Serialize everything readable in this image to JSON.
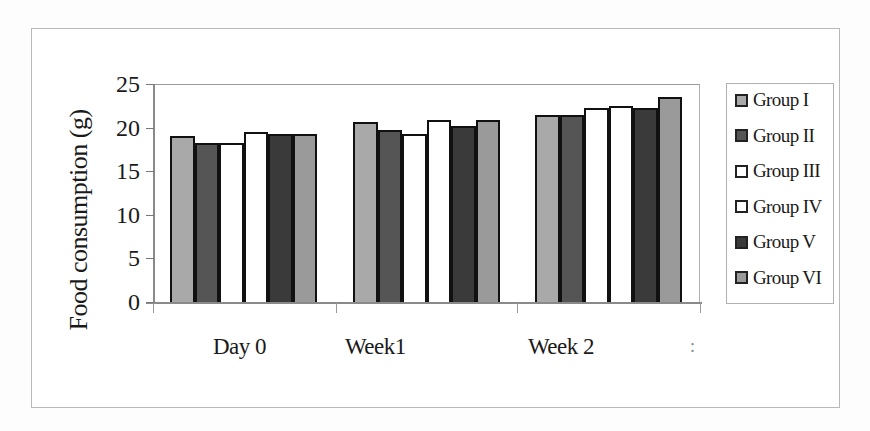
{
  "chart_data": {
    "type": "bar",
    "title": "",
    "xlabel": "",
    "ylabel": "Food consumption (g)",
    "ylim": [
      0,
      25
    ],
    "yticks": [
      0,
      5,
      10,
      15,
      20,
      25
    ],
    "grid": false,
    "legend_position": "right",
    "categories": [
      "Day 0",
      "Week1",
      "Week 2"
    ],
    "series": [
      {
        "name": "Group I",
        "color": "#a9a9a9",
        "values": [
          19.0,
          20.6,
          21.5
        ]
      },
      {
        "name": "Group II",
        "color": "#555555",
        "values": [
          18.2,
          19.7,
          21.5
        ]
      },
      {
        "name": "Group III",
        "color": "#ffffff",
        "values": [
          18.2,
          19.3,
          22.2
        ]
      },
      {
        "name": "Group IV",
        "color": "#ffffff",
        "values": [
          19.5,
          20.9,
          22.5
        ]
      },
      {
        "name": "Group V",
        "color": "#3a3a3a",
        "values": [
          19.3,
          20.2,
          22.2
        ]
      },
      {
        "name": "Group VI",
        "color": "#9a9a9a",
        "values": [
          19.3,
          20.9,
          23.5
        ]
      }
    ]
  },
  "axis": {
    "ytick_labels": [
      "25",
      "20",
      "15",
      "10",
      "5",
      "0"
    ],
    "stray_label": ":"
  }
}
